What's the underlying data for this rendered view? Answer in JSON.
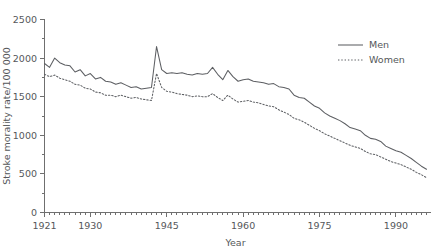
{
  "chart_data": {
    "type": "line",
    "title": "",
    "xlabel": "Year",
    "ylabel": "Stroke morality rate/100 000",
    "xlim": [
      1921,
      1996
    ],
    "ylim": [
      0,
      2500
    ],
    "grid": false,
    "legend_position": "top-right",
    "y_ticks": [
      0,
      500,
      1000,
      1500,
      2000,
      2500
    ],
    "y_tick_labels": [
      "0",
      "500",
      "1000",
      "1500",
      "2000",
      "2500"
    ],
    "x_ticks": [
      1921,
      1930,
      1945,
      1960,
      1975,
      1990
    ],
    "x_tick_labels": [
      "1921",
      "1930",
      "1945",
      "1960",
      "1975",
      "1990"
    ],
    "x_minor_tick_step": 1,
    "y_minor_tick_step": 250,
    "series": [
      {
        "name": "Men",
        "style": "solid",
        "color": "#5d5f63",
        "x": [
          1921,
          1922,
          1923,
          1924,
          1925,
          1926,
          1927,
          1928,
          1929,
          1930,
          1931,
          1932,
          1933,
          1934,
          1935,
          1936,
          1937,
          1938,
          1939,
          1940,
          1941,
          1942,
          1943,
          1944,
          1945,
          1946,
          1947,
          1948,
          1949,
          1950,
          1951,
          1952,
          1953,
          1954,
          1955,
          1956,
          1957,
          1958,
          1959,
          1960,
          1961,
          1962,
          1963,
          1964,
          1965,
          1966,
          1967,
          1968,
          1969,
          1970,
          1971,
          1972,
          1973,
          1974,
          1975,
          1976,
          1977,
          1978,
          1979,
          1980,
          1981,
          1982,
          1983,
          1984,
          1985,
          1986,
          1987,
          1988,
          1989,
          1990,
          1991,
          1992,
          1993,
          1994,
          1995,
          1996
        ],
        "values": [
          1930,
          1880,
          2000,
          1940,
          1910,
          1900,
          1820,
          1850,
          1770,
          1800,
          1730,
          1750,
          1700,
          1690,
          1660,
          1680,
          1650,
          1620,
          1630,
          1600,
          1610,
          1620,
          2150,
          1850,
          1800,
          1810,
          1800,
          1810,
          1790,
          1780,
          1800,
          1790,
          1800,
          1880,
          1790,
          1720,
          1840,
          1760,
          1700,
          1720,
          1730,
          1700,
          1690,
          1680,
          1660,
          1670,
          1630,
          1620,
          1600,
          1520,
          1490,
          1480,
          1430,
          1380,
          1350,
          1290,
          1250,
          1220,
          1190,
          1150,
          1100,
          1080,
          1060,
          1000,
          960,
          950,
          920,
          860,
          830,
          800,
          780,
          740,
          700,
          650,
          600,
          560
        ]
      },
      {
        "name": "Women",
        "style": "dotted",
        "color": "#5d5f63",
        "x": [
          1921,
          1922,
          1923,
          1924,
          1925,
          1926,
          1927,
          1928,
          1929,
          1930,
          1931,
          1932,
          1933,
          1934,
          1935,
          1936,
          1937,
          1938,
          1939,
          1940,
          1941,
          1942,
          1943,
          1944,
          1945,
          1946,
          1947,
          1948,
          1949,
          1950,
          1951,
          1952,
          1953,
          1954,
          1955,
          1956,
          1957,
          1958,
          1959,
          1960,
          1961,
          1962,
          1963,
          1964,
          1965,
          1966,
          1967,
          1968,
          1969,
          1970,
          1971,
          1972,
          1973,
          1974,
          1975,
          1976,
          1977,
          1978,
          1979,
          1980,
          1981,
          1982,
          1983,
          1984,
          1985,
          1986,
          1987,
          1988,
          1989,
          1990,
          1991,
          1992,
          1993,
          1994,
          1995,
          1996
        ],
        "values": [
          1790,
          1760,
          1780,
          1740,
          1720,
          1700,
          1660,
          1650,
          1610,
          1600,
          1560,
          1550,
          1520,
          1520,
          1500,
          1520,
          1500,
          1480,
          1490,
          1470,
          1460,
          1450,
          1800,
          1620,
          1570,
          1560,
          1540,
          1530,
          1520,
          1500,
          1510,
          1500,
          1500,
          1540,
          1490,
          1450,
          1520,
          1470,
          1430,
          1440,
          1450,
          1430,
          1420,
          1400,
          1380,
          1370,
          1330,
          1300,
          1270,
          1220,
          1200,
          1170,
          1130,
          1090,
          1060,
          1020,
          990,
          960,
          930,
          900,
          870,
          850,
          830,
          790,
          760,
          750,
          720,
          690,
          660,
          640,
          620,
          590,
          560,
          520,
          490,
          450
        ]
      }
    ]
  },
  "legend": {
    "items": [
      {
        "label": "Men",
        "style": "solid"
      },
      {
        "label": "Women",
        "style": "dotted"
      }
    ]
  }
}
